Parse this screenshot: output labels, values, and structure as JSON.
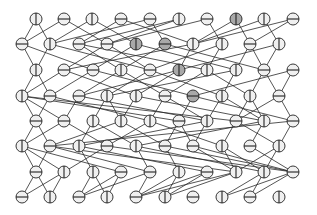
{
  "diagram": {
    "type": "layered-network",
    "node_radius": 6,
    "colors": {
      "edge": "#2a2a2a",
      "node_stroke": "#222222",
      "node_fill_light": "#f0f0f0",
      "node_fill_gray": "#a8a8a8"
    },
    "rows": [
      {
        "y": 19,
        "x": [
          36,
          64,
          92,
          121,
          150,
          179,
          207,
          236,
          264,
          293
        ],
        "marks": [
          "v",
          "h",
          "v",
          "h",
          "h",
          "v",
          "h",
          "v",
          "v",
          "h"
        ],
        "gray": [
          0,
          0,
          0,
          0,
          0,
          0,
          0,
          1,
          0,
          0
        ]
      },
      {
        "y": 44,
        "x": [
          22,
          50,
          79,
          107,
          136,
          165,
          193,
          222,
          250,
          279
        ],
        "marks": [
          "h",
          "v",
          "h",
          "h",
          "v",
          "h",
          "v",
          "v",
          "h",
          "v"
        ],
        "gray": [
          0,
          0,
          0,
          0,
          1,
          1,
          0,
          0,
          0,
          0
        ]
      },
      {
        "y": 70,
        "x": [
          36,
          64,
          93,
          121,
          150,
          179,
          207,
          236,
          264,
          293
        ],
        "marks": [
          "v",
          "h",
          "h",
          "v",
          "h",
          "v",
          "v",
          "v",
          "h",
          "h"
        ],
        "gray": [
          0,
          0,
          0,
          0,
          0,
          1,
          0,
          0,
          0,
          0
        ]
      },
      {
        "y": 96,
        "x": [
          22,
          50,
          79,
          107,
          136,
          165,
          193,
          222,
          250,
          279
        ],
        "marks": [
          "v",
          "h",
          "h",
          "v",
          "v",
          "h",
          "h",
          "v",
          "v",
          "h"
        ],
        "gray": [
          0,
          0,
          0,
          0,
          0,
          0,
          1,
          0,
          0,
          0
        ]
      },
      {
        "y": 121,
        "x": [
          36,
          64,
          93,
          121,
          150,
          179,
          207,
          236,
          264,
          293
        ],
        "marks": [
          "h",
          "h",
          "v",
          "v",
          "v",
          "h",
          "v",
          "h",
          "v",
          "h"
        ],
        "gray": [
          0,
          0,
          0,
          0,
          0,
          0,
          0,
          0,
          0,
          0
        ]
      },
      {
        "y": 146,
        "x": [
          22,
          50,
          79,
          107,
          136,
          165,
          193,
          222,
          250,
          279
        ],
        "marks": [
          "v",
          "h",
          "v",
          "h",
          "v",
          "h",
          "h",
          "v",
          "h",
          "v"
        ],
        "gray": [
          0,
          0,
          0,
          0,
          0,
          0,
          0,
          0,
          0,
          0
        ]
      },
      {
        "y": 172,
        "x": [
          36,
          64,
          93,
          121,
          150,
          179,
          207,
          236,
          264,
          293
        ],
        "marks": [
          "h",
          "v",
          "v",
          "h",
          "h",
          "v",
          "h",
          "v",
          "v",
          "h"
        ],
        "gray": [
          0,
          0,
          0,
          0,
          0,
          0,
          0,
          0,
          0,
          0
        ]
      },
      {
        "y": 197,
        "x": [
          22,
          50,
          79,
          107,
          136,
          165,
          193,
          222,
          250,
          279
        ],
        "marks": [
          "h",
          "v",
          "h",
          "v",
          "h",
          "v",
          "h",
          "v",
          "h",
          "v"
        ],
        "gray": [
          0,
          0,
          0,
          0,
          0,
          0,
          0,
          0,
          0,
          0
        ]
      }
    ],
    "edges": [
      [
        0,
        0,
        1,
        0
      ],
      [
        0,
        0,
        1,
        1
      ],
      [
        0,
        1,
        1,
        0
      ],
      [
        0,
        1,
        1,
        3
      ],
      [
        0,
        2,
        1,
        1
      ],
      [
        0,
        2,
        1,
        4
      ],
      [
        0,
        3,
        1,
        2
      ],
      [
        0,
        3,
        1,
        6
      ],
      [
        0,
        4,
        1,
        1
      ],
      [
        0,
        4,
        1,
        5
      ],
      [
        0,
        5,
        1,
        2
      ],
      [
        0,
        5,
        1,
        3
      ],
      [
        0,
        6,
        1,
        3
      ],
      [
        0,
        6,
        1,
        7
      ],
      [
        0,
        7,
        1,
        6
      ],
      [
        0,
        7,
        1,
        8
      ],
      [
        0,
        8,
        1,
        6
      ],
      [
        0,
        8,
        1,
        9
      ],
      [
        0,
        9,
        1,
        6
      ],
      [
        0,
        9,
        1,
        8
      ],
      [
        1,
        0,
        2,
        0
      ],
      [
        1,
        0,
        2,
        2
      ],
      [
        1,
        1,
        2,
        0
      ],
      [
        1,
        1,
        2,
        4
      ],
      [
        1,
        2,
        2,
        3
      ],
      [
        1,
        2,
        2,
        6
      ],
      [
        1,
        3,
        2,
        1
      ],
      [
        1,
        3,
        2,
        4
      ],
      [
        1,
        4,
        2,
        2
      ],
      [
        1,
        4,
        2,
        7
      ],
      [
        1,
        5,
        2,
        3
      ],
      [
        1,
        5,
        2,
        8
      ],
      [
        1,
        6,
        2,
        5
      ],
      [
        1,
        6,
        2,
        1
      ],
      [
        1,
        7,
        2,
        6
      ],
      [
        1,
        7,
        2,
        4
      ],
      [
        1,
        8,
        2,
        8
      ],
      [
        1,
        8,
        2,
        7
      ],
      [
        1,
        9,
        2,
        8
      ],
      [
        1,
        9,
        2,
        5
      ],
      [
        2,
        0,
        3,
        0
      ],
      [
        2,
        0,
        3,
        1
      ],
      [
        2,
        1,
        3,
        0
      ],
      [
        2,
        1,
        3,
        4
      ],
      [
        2,
        2,
        3,
        1
      ],
      [
        2,
        2,
        3,
        6
      ],
      [
        2,
        3,
        3,
        2
      ],
      [
        2,
        3,
        3,
        5
      ],
      [
        2,
        4,
        3,
        3
      ],
      [
        2,
        4,
        3,
        7
      ],
      [
        2,
        5,
        3,
        4
      ],
      [
        2,
        5,
        3,
        2
      ],
      [
        2,
        6,
        3,
        5
      ],
      [
        2,
        6,
        3,
        8
      ],
      [
        2,
        7,
        3,
        7
      ],
      [
        2,
        7,
        3,
        3
      ],
      [
        2,
        8,
        3,
        8
      ],
      [
        2,
        8,
        3,
        9
      ],
      [
        2,
        9,
        3,
        9
      ],
      [
        2,
        9,
        3,
        6
      ],
      [
        3,
        0,
        4,
        0
      ],
      [
        3,
        0,
        4,
        1
      ],
      [
        3,
        0,
        4,
        5
      ],
      [
        3,
        0,
        4,
        7
      ],
      [
        3,
        1,
        4,
        0
      ],
      [
        3,
        1,
        4,
        4
      ],
      [
        3,
        2,
        4,
        1
      ],
      [
        3,
        2,
        4,
        6
      ],
      [
        3,
        3,
        4,
        2
      ],
      [
        3,
        3,
        4,
        3
      ],
      [
        3,
        4,
        4,
        3
      ],
      [
        3,
        4,
        4,
        8
      ],
      [
        3,
        5,
        4,
        4
      ],
      [
        3,
        5,
        4,
        6
      ],
      [
        3,
        6,
        4,
        5
      ],
      [
        3,
        6,
        4,
        9
      ],
      [
        3,
        7,
        4,
        6
      ],
      [
        3,
        7,
        4,
        8
      ],
      [
        3,
        8,
        4,
        7
      ],
      [
        3,
        8,
        4,
        8
      ],
      [
        3,
        9,
        4,
        9
      ],
      [
        3,
        9,
        4,
        7
      ],
      [
        4,
        0,
        5,
        0
      ],
      [
        4,
        0,
        5,
        1
      ],
      [
        4,
        1,
        5,
        0
      ],
      [
        4,
        1,
        5,
        3
      ],
      [
        4,
        2,
        5,
        2
      ],
      [
        4,
        2,
        5,
        4
      ],
      [
        4,
        3,
        5,
        1
      ],
      [
        4,
        3,
        5,
        5
      ],
      [
        4,
        4,
        5,
        3
      ],
      [
        4,
        4,
        5,
        7
      ],
      [
        4,
        5,
        5,
        5
      ],
      [
        4,
        5,
        5,
        6
      ],
      [
        4,
        6,
        5,
        6
      ],
      [
        4,
        6,
        5,
        2
      ],
      [
        4,
        7,
        5,
        7
      ],
      [
        4,
        7,
        5,
        9
      ],
      [
        4,
        8,
        5,
        8
      ],
      [
        4,
        8,
        5,
        4
      ],
      [
        4,
        9,
        5,
        9
      ],
      [
        4,
        9,
        5,
        1
      ],
      [
        5,
        0,
        6,
        0
      ],
      [
        5,
        0,
        6,
        1
      ],
      [
        5,
        0,
        6,
        3
      ],
      [
        5,
        1,
        6,
        0
      ],
      [
        5,
        1,
        6,
        4
      ],
      [
        5,
        1,
        6,
        7
      ],
      [
        5,
        2,
        6,
        2
      ],
      [
        5,
        2,
        6,
        6
      ],
      [
        5,
        3,
        6,
        1
      ],
      [
        5,
        3,
        6,
        9
      ],
      [
        5,
        4,
        6,
        4
      ],
      [
        5,
        4,
        6,
        8
      ],
      [
        5,
        5,
        6,
        5
      ],
      [
        5,
        5,
        6,
        9
      ],
      [
        5,
        6,
        6,
        7
      ],
      [
        5,
        6,
        6,
        9
      ],
      [
        5,
        7,
        6,
        8
      ],
      [
        5,
        7,
        6,
        7
      ],
      [
        5,
        8,
        6,
        9
      ],
      [
        5,
        9,
        6,
        8
      ],
      [
        5,
        9,
        6,
        7
      ],
      [
        6,
        0,
        7,
        0
      ],
      [
        6,
        0,
        7,
        1
      ],
      [
        6,
        1,
        7,
        0
      ],
      [
        6,
        1,
        7,
        1
      ],
      [
        6,
        2,
        7,
        2
      ],
      [
        6,
        2,
        7,
        3
      ],
      [
        6,
        3,
        7,
        2
      ],
      [
        6,
        3,
        7,
        3
      ],
      [
        6,
        4,
        7,
        2
      ],
      [
        6,
        4,
        7,
        4
      ],
      [
        6,
        5,
        7,
        4
      ],
      [
        6,
        5,
        7,
        5
      ],
      [
        6,
        6,
        7,
        4
      ],
      [
        6,
        6,
        7,
        5
      ],
      [
        6,
        7,
        7,
        5
      ],
      [
        6,
        7,
        7,
        4
      ],
      [
        6,
        8,
        7,
        7
      ],
      [
        6,
        8,
        7,
        8
      ],
      [
        6,
        9,
        7,
        7
      ],
      [
        6,
        9,
        7,
        8
      ]
    ]
  }
}
